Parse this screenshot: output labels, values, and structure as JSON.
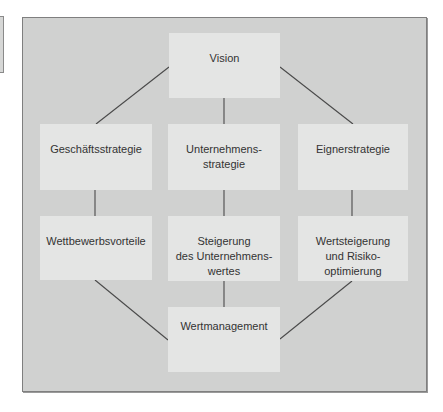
{
  "diagram": {
    "nodes": {
      "vision": "Vision",
      "geschaeftsstrategie": "Geschäftsstrategie",
      "unternehmensstrategie": "Unternehmens-\nstrategie",
      "eignerstrategie": "Eignerstrategie",
      "wettbewerbsvorteile": "Wettbewerbsvorteile",
      "steigerung": "Steigerung\ndes Unternehmens-\nwertes",
      "wertsteigerung": "Wertsteigerung\nund Risiko-\noptimierung",
      "wertmanagement": "Wertmanagement"
    },
    "edges": [
      [
        "vision",
        "geschaeftsstrategie"
      ],
      [
        "vision",
        "unternehmensstrategie"
      ],
      [
        "vision",
        "eignerstrategie"
      ],
      [
        "geschaeftsstrategie",
        "wettbewerbsvorteile"
      ],
      [
        "unternehmensstrategie",
        "steigerung"
      ],
      [
        "eignerstrategie",
        "wertsteigerung"
      ],
      [
        "wettbewerbsvorteile",
        "wertmanagement"
      ],
      [
        "steigerung",
        "wertmanagement"
      ],
      [
        "wertsteigerung",
        "wertmanagement"
      ]
    ],
    "colors": {
      "frame_bg": "#d0d1d0",
      "node_bg": "#e4e5e4",
      "line": "#4a4a4a",
      "text": "#333333"
    }
  }
}
